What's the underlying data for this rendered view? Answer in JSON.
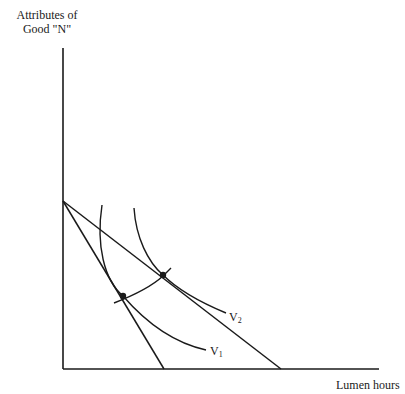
{
  "diagram": {
    "title": "",
    "y_axis_label_line1": "Attributes of",
    "y_axis_label_line2": "Good \"N\"",
    "x_axis_label": "Lumen hours",
    "curves": [
      {
        "id": "V1",
        "letter": "V",
        "subscript": "1",
        "type": "indifference-curve"
      },
      {
        "id": "V2",
        "letter": "V",
        "subscript": "2",
        "type": "indifference-curve"
      }
    ],
    "budget_lines": [
      {
        "id": "steep",
        "from": "y-intercept",
        "to_x_pixel": 164
      },
      {
        "id": "shallow",
        "from": "y-intercept",
        "to_x_pixel": 281
      }
    ],
    "tangency_points": [
      {
        "on": "V1",
        "line": "steep"
      },
      {
        "on": "V2",
        "line": "shallow"
      }
    ],
    "colors": {
      "ink": "#1a1a1a",
      "background": "#ffffff"
    }
  }
}
